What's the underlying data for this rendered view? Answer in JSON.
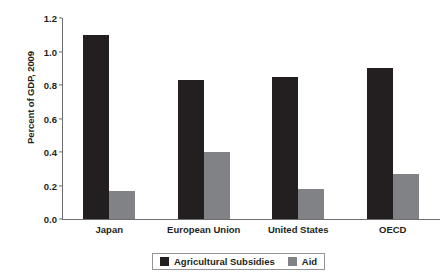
{
  "chart_data": {
    "type": "bar",
    "title": "",
    "subtitle": "",
    "xlabel": "",
    "ylabel": "Percent of GDP, 2009",
    "categories": [
      "Japan",
      "European Union",
      "United States",
      "OECD"
    ],
    "series": [
      {
        "name": "Agricultural Subsidies",
        "color": "#231f20",
        "values": [
          1.1,
          0.83,
          0.85,
          0.9
        ]
      },
      {
        "name": "Aid",
        "color": "#808285",
        "values": [
          0.17,
          0.4,
          0.18,
          0.27
        ]
      }
    ],
    "ylim": [
      0.0,
      1.2
    ],
    "ytick_step": 0.2,
    "ytick_labels": [
      "1.2",
      "1.0",
      "0.8",
      "0.6",
      "0.4",
      "0.2",
      "0.0"
    ],
    "ytick_values": [
      1.2,
      1.0,
      0.8,
      0.6,
      0.4,
      0.2,
      0.0
    ],
    "grid": false,
    "legend_position": "bottom-center",
    "legend_entries": [
      {
        "label": "Agricultural Subsidies",
        "color": "#231f20"
      },
      {
        "label": "Aid",
        "color": "#808285"
      }
    ],
    "axis_color": "#6d6e71",
    "background_color": "#ffffff"
  }
}
